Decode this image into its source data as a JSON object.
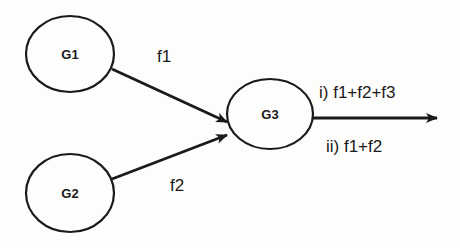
{
  "diagram": {
    "colors": {
      "stroke": "#1a1a1a",
      "background": "#fdfdfb"
    },
    "nodes": [
      {
        "id": "G1",
        "label": "G1",
        "cx": 70,
        "cy": 54,
        "rx": 44,
        "ry": 38
      },
      {
        "id": "G2",
        "label": "G2",
        "cx": 70,
        "cy": 193,
        "rx": 44,
        "ry": 39
      },
      {
        "id": "G3",
        "label": "G3",
        "cx": 270,
        "cy": 114,
        "rx": 43,
        "ry": 35
      }
    ],
    "edges": [
      {
        "from": "G1",
        "to": "G3",
        "label": "f1"
      },
      {
        "from": "G2",
        "to": "G3",
        "label": "f2"
      },
      {
        "from": "G3",
        "to": "output",
        "label_top": "i) f1+f2+f3",
        "label_bottom": "ii) f1+f2"
      }
    ]
  }
}
